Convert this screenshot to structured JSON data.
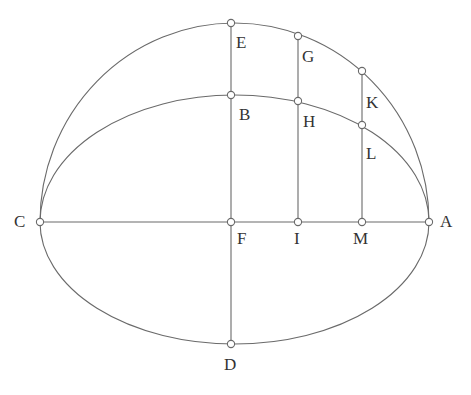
{
  "diagram": {
    "type": "geometric-construction",
    "points": {
      "A": {
        "label": "A",
        "x": 429,
        "y": 222
      },
      "B": {
        "label": "B",
        "x": 231,
        "y": 95
      },
      "C": {
        "label": "C",
        "x": 40,
        "y": 222
      },
      "D": {
        "label": "D",
        "x": 231,
        "y": 344
      },
      "E": {
        "label": "E",
        "x": 231,
        "y": 23
      },
      "F": {
        "label": "F",
        "x": 231,
        "y": 222
      },
      "G": {
        "label": "G",
        "x": 298,
        "y": 36
      },
      "H": {
        "label": "H",
        "x": 298,
        "y": 101
      },
      "I": {
        "label": "I",
        "x": 298,
        "y": 222
      },
      "K": {
        "label": "K",
        "x": 362,
        "y": 71
      },
      "L": {
        "label": "L",
        "x": 362,
        "y": 125
      },
      "M": {
        "label": "M",
        "x": 362,
        "y": 222
      }
    },
    "segments": [
      "CA",
      "ED",
      "GI",
      "KM"
    ],
    "curves": [
      "arc C-E-G-K-A (outer)",
      "arc C-B-H-L-A (inner ellipse)",
      "arc C-D-A (lower)"
    ],
    "colors": {
      "stroke": "#6a6a6a",
      "label": "#333333",
      "background": "#ffffff"
    }
  }
}
